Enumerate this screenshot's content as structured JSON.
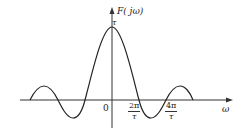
{
  "diagram": {
    "type": "sinc-spectrum",
    "y_axis_label": "F( jω)",
    "x_axis_label": "ω",
    "origin_label": "0",
    "peak_label": "τ",
    "ticks": [
      {
        "num": "2π",
        "den": "τ"
      },
      {
        "num": "4π",
        "den": "τ"
      }
    ],
    "colors": {
      "curve": "#222222",
      "axis": "#333333",
      "background": "#ffffff"
    }
  }
}
